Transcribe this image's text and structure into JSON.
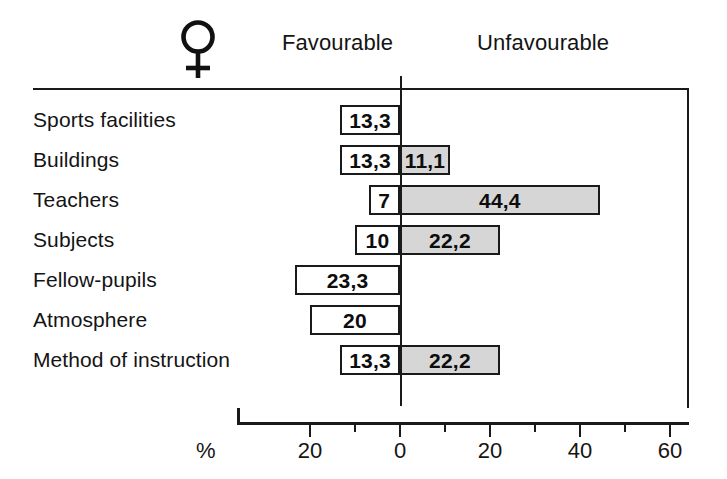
{
  "header": {
    "gender_symbol": "venus-female-symbol",
    "gender_glyph": "♀",
    "left_column": "Favourable",
    "right_column": "Unfavourable"
  },
  "axis": {
    "unit_label": "%",
    "tick_labels": [
      "20",
      "0",
      "20",
      "40",
      "60"
    ],
    "tick_values": [
      -20,
      0,
      20,
      40,
      60
    ],
    "minor_tick_values": [
      -10,
      10,
      30,
      50
    ]
  },
  "colors": {
    "favourable_fill": "#ffffff",
    "unfavourable_fill": "#d6d6d6",
    "stroke": "#1a1a1a",
    "text": "#141414"
  },
  "rows": [
    {
      "label": "Sports facilities",
      "favourable": 13.3,
      "favourable_text": "13,3",
      "unfavourable": 0,
      "unfavourable_text": ""
    },
    {
      "label": "Buildings",
      "favourable": 13.3,
      "favourable_text": "13,3",
      "unfavourable": 11.1,
      "unfavourable_text": "11,1"
    },
    {
      "label": "Teachers",
      "favourable": 7,
      "favourable_text": "7",
      "unfavourable": 44.4,
      "unfavourable_text": "44,4"
    },
    {
      "label": "Subjects",
      "favourable": 10,
      "favourable_text": "10",
      "unfavourable": 22.2,
      "unfavourable_text": "22,2"
    },
    {
      "label": "Fellow-pupils",
      "favourable": 23.3,
      "favourable_text": "23,3",
      "unfavourable": 0,
      "unfavourable_text": ""
    },
    {
      "label": "Atmosphere",
      "favourable": 20,
      "favourable_text": "20",
      "unfavourable": 0,
      "unfavourable_text": ""
    },
    {
      "label": "Method of instruction",
      "favourable": 13.3,
      "favourable_text": "13,3",
      "unfavourable": 22.2,
      "unfavourable_text": "22,2"
    }
  ],
  "chart_data": {
    "type": "bar",
    "orientation": "horizontal",
    "subtype": "diverging-tornado",
    "title": "",
    "subtitle": "",
    "xlabel": "%",
    "ylabel": "",
    "categories": [
      "Sports facilities",
      "Buildings",
      "Teachers",
      "Subjects",
      "Fellow-pupils",
      "Atmosphere",
      "Method of instruction"
    ],
    "series": [
      {
        "name": "Favourable",
        "direction": "left",
        "fill": "#ffffff",
        "values": [
          13.3,
          13.3,
          7,
          10,
          23.3,
          20,
          13.3
        ],
        "labels": [
          "13,3",
          "13,3",
          "7",
          "10",
          "23,3",
          "20",
          "13,3"
        ]
      },
      {
        "name": "Unfavourable",
        "direction": "right",
        "fill": "#d6d6d6",
        "values": [
          0,
          11.1,
          44.4,
          22.2,
          0,
          0,
          22.2
        ],
        "labels": [
          "",
          "11,1",
          "44,4",
          "22,2",
          "",
          "",
          "22,2"
        ]
      }
    ],
    "xlim": [
      -36,
      64
    ],
    "xticks": [
      -20,
      0,
      20,
      40,
      60
    ],
    "xtick_labels": [
      "20",
      "0",
      "20",
      "40",
      "60"
    ],
    "xminor_ticks": [
      -10,
      10,
      30,
      50
    ],
    "grid": false,
    "legend": "column-headers-above-plot",
    "annotations": [
      "♀ (female respondents)"
    ]
  }
}
